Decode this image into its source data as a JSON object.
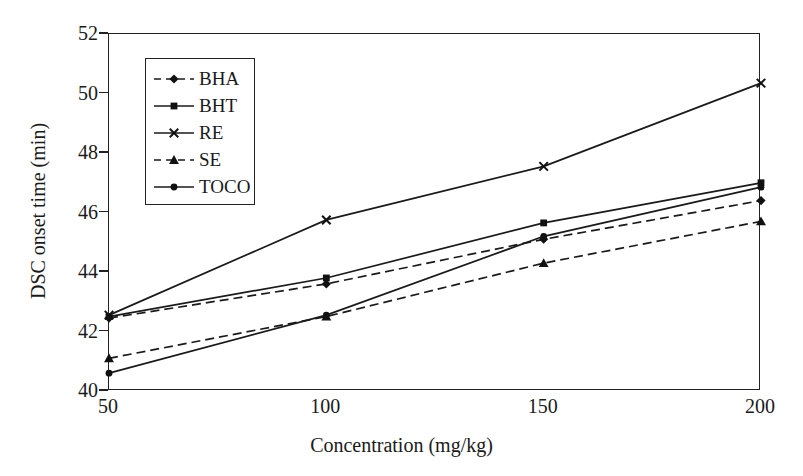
{
  "chart_data": {
    "type": "line",
    "title": "",
    "xlabel": "Concentration (mg/kg)",
    "ylabel": "DSC onset time (min)",
    "x": [
      50,
      100,
      150,
      200
    ],
    "xtick_labels": [
      "50",
      "100",
      "150",
      "200"
    ],
    "ytick_labels": [
      "40",
      "42",
      "44",
      "46",
      "48",
      "50",
      "52"
    ],
    "xlim": [
      50,
      200
    ],
    "ylim": [
      40,
      52
    ],
    "grid": false,
    "legend_position": "upper-left-inside",
    "series": [
      {
        "name": "BHA",
        "values": [
          42.45,
          43.6,
          45.1,
          46.4
        ],
        "marker": "diamond",
        "linestyle": "dashed",
        "color": "#1a1a1a"
      },
      {
        "name": "BHT",
        "values": [
          42.5,
          43.8,
          45.65,
          47.0
        ],
        "marker": "square",
        "linestyle": "solid",
        "color": "#1a1a1a"
      },
      {
        "name": "RE",
        "values": [
          42.55,
          45.75,
          47.55,
          50.35
        ],
        "marker": "x",
        "linestyle": "solid",
        "color": "#1a1a1a"
      },
      {
        "name": "SE",
        "values": [
          41.1,
          42.5,
          44.3,
          45.7
        ],
        "marker": "triangle",
        "linestyle": "dashed",
        "color": "#1a1a1a"
      },
      {
        "name": "TOCO",
        "values": [
          40.6,
          42.55,
          45.2,
          46.85
        ],
        "marker": "circle",
        "linestyle": "solid",
        "color": "#1a1a1a"
      }
    ]
  }
}
